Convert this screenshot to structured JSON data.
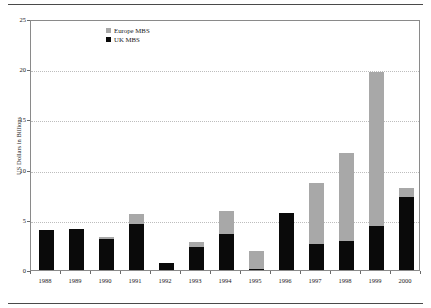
{
  "chart_data": {
    "type": "bar",
    "title": "",
    "subtitle": "",
    "xlabel": "",
    "ylabel": "US Dollars in Billions",
    "categories": [
      "1988",
      "1989",
      "1990",
      "1991",
      "1992",
      "1993",
      "1994",
      "1995",
      "1996",
      "1997",
      "1998",
      "1999",
      "2000"
    ],
    "series": [
      {
        "name": "UK MBS",
        "color": "#0a0a0a",
        "values": [
          4.0,
          4.1,
          3.1,
          4.6,
          0.7,
          2.3,
          3.6,
          0.1,
          5.7,
          2.6,
          2.9,
          4.4,
          7.3
        ]
      },
      {
        "name": "Europe MBS",
        "color": "#a8a8a8",
        "values": [
          0.0,
          0.0,
          0.2,
          1.0,
          0.0,
          0.5,
          2.3,
          1.8,
          0.0,
          6.1,
          8.8,
          15.3,
          0.9
        ]
      }
    ],
    "totals": [
      4.0,
      4.1,
      3.3,
      5.6,
      0.7,
      2.8,
      5.9,
      1.9,
      5.7,
      8.7,
      11.7,
      19.7,
      8.2
    ],
    "stacked": true,
    "ylim": [
      0,
      25
    ],
    "yticks": [
      0,
      5,
      10,
      15,
      20,
      25
    ],
    "ytick_labels": [
      "0",
      "5",
      "10",
      "15",
      "20",
      "25"
    ],
    "grid": true,
    "grid_axis": "y",
    "legend_position": "top-left-inside"
  },
  "legend": {
    "entries": [
      {
        "label": "Europe MBS",
        "swatch": "europe-swatch"
      },
      {
        "label": "UK MBS",
        "swatch": "uk-swatch"
      }
    ]
  },
  "colors": {
    "europe": "#a8a8a8",
    "uk": "#0a0a0a",
    "grid": "#bdbdbd",
    "frame": "#8a8a8a",
    "rule": "#4a4a4a",
    "text": "#1a1a1a"
  }
}
